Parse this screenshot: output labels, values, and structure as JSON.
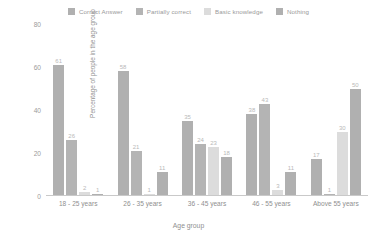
{
  "chart_data": {
    "type": "bar",
    "title": "",
    "xlabel": "Age group",
    "ylabel": "Percentage of people in the age group",
    "ylim": [
      0,
      80
    ],
    "yticks": [
      0,
      20,
      40,
      60,
      80
    ],
    "grid": false,
    "legend_position": "top-center",
    "categories": [
      "18 - 25 years",
      "26 - 35 years",
      "36 - 45 years",
      "46 - 55 years",
      "Above 55 years"
    ],
    "series": [
      {
        "name": "Correct Answer",
        "color": "#b0b0b0",
        "values": [
          61,
          58,
          35,
          38,
          17
        ]
      },
      {
        "name": "Partially correct",
        "color": "#b4b4b4",
        "values": [
          26,
          21,
          24,
          43,
          1
        ]
      },
      {
        "name": "Basic knowledge",
        "color": "#dcdcdc",
        "values": [
          2,
          1,
          23,
          3,
          30
        ]
      },
      {
        "name": "Nothing",
        "color": "#b0b0b0",
        "values": [
          1,
          11,
          18,
          11,
          50
        ]
      }
    ]
  },
  "legend": {
    "items": [
      {
        "label": "Correct Answer",
        "color": "#b0b0b0"
      },
      {
        "label": "Partially correct",
        "color": "#b4b4b4"
      },
      {
        "label": "Basic knowledge",
        "color": "#dcdcdc"
      },
      {
        "label": "Nothing",
        "color": "#b0b0b0"
      }
    ]
  }
}
